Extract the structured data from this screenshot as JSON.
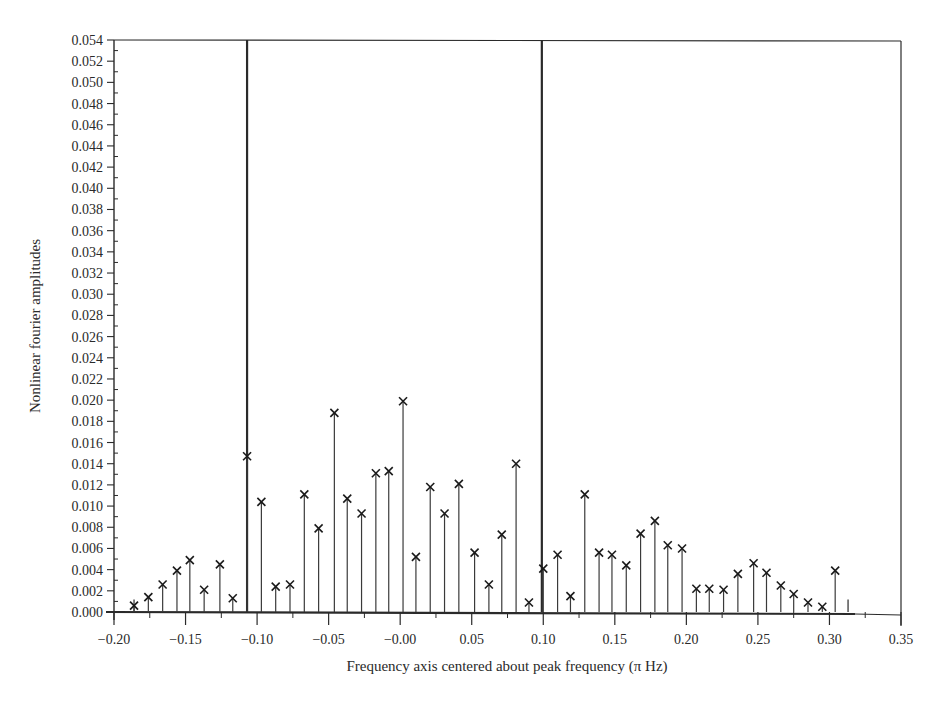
{
  "chart_data": {
    "type": "stem",
    "title": "",
    "xlabel": "Frequency axis centered about peak frequency (π Hz)",
    "ylabel": "Nonlinear fourier amplitudes",
    "xlim": [
      -0.2,
      0.35
    ],
    "ylim": [
      0.0,
      0.054
    ],
    "x_ticks": [
      "−0.20",
      "−0.15",
      "−0.10",
      "−0.05",
      "−0.00",
      "0.05",
      "0.10",
      "0.15",
      "0.20",
      "0.25",
      "0.30",
      "0.35"
    ],
    "x_tick_values": [
      -0.2,
      -0.15,
      -0.1,
      -0.05,
      0.0,
      0.05,
      0.1,
      0.15,
      0.2,
      0.25,
      0.3,
      0.35
    ],
    "y_ticks": [
      "0.000",
      "0.002",
      "0.004",
      "0.006",
      "0.008",
      "0.010",
      "0.012",
      "0.014",
      "0.016",
      "0.018",
      "0.020",
      "0.022",
      "0.024",
      "0.026",
      "0.028",
      "0.030",
      "0.032",
      "0.034",
      "0.036",
      "0.038",
      "0.040",
      "0.042",
      "0.044",
      "0.046",
      "0.048",
      "0.050",
      "0.052",
      "0.054"
    ],
    "grid": false,
    "legend": null,
    "marker": "x",
    "series": [
      {
        "name": "Nonlinear fourier amplitudes",
        "x": [
          -0.186,
          -0.176,
          -0.166,
          -0.156,
          -0.147,
          -0.137,
          -0.126,
          -0.117,
          -0.107,
          -0.097,
          -0.087,
          -0.077,
          -0.067,
          -0.057,
          -0.046,
          -0.037,
          -0.027,
          -0.017,
          -0.008,
          0.002,
          0.011,
          0.021,
          0.031,
          0.041,
          0.052,
          0.062,
          0.071,
          0.081,
          0.09,
          0.1,
          0.11,
          0.119,
          0.129,
          0.139,
          0.148,
          0.158,
          0.168,
          0.178,
          0.187,
          0.197,
          0.207,
          0.216,
          0.226,
          0.236,
          0.247,
          0.256,
          0.266,
          0.275,
          0.285,
          0.295,
          0.304
        ],
        "values": [
          0.0006,
          0.0014,
          0.0026,
          0.0039,
          0.0049,
          0.0021,
          0.0045,
          0.0013,
          0.0147,
          0.0104,
          0.0024,
          0.0026,
          0.0111,
          0.0079,
          0.0188,
          0.0107,
          0.0093,
          0.0131,
          0.0133,
          0.0199,
          0.0052,
          0.0118,
          0.0093,
          0.0121,
          0.0056,
          0.0026,
          0.0073,
          0.014,
          0.0009,
          0.0041,
          0.0054,
          0.0015,
          0.0111,
          0.0056,
          0.0054,
          0.0044,
          0.0074,
          0.0086,
          0.0063,
          0.006,
          0.0022,
          0.0022,
          0.0021,
          0.0036,
          0.0046,
          0.0037,
          0.0025,
          0.0017,
          0.0009,
          0.0005,
          0.0039
        ]
      }
    ],
    "annotations": [
      {
        "type": "vertical_line",
        "x": -0.107,
        "y_top": 0.054,
        "description": "tall boundary line"
      },
      {
        "type": "vertical_line",
        "x": 0.099,
        "y_top": 0.054,
        "description": "tall boundary line"
      },
      {
        "type": "end_tick",
        "x": -0.186,
        "y": 0.001
      },
      {
        "type": "end_tick",
        "x": 0.313,
        "y": 0.001
      }
    ]
  },
  "layout": {
    "plot_left": 114,
    "plot_right": 901,
    "plot_top": 40,
    "plot_bottom": 612,
    "colors": {
      "axis": "#2a2a2a",
      "stem": "#3a3a3a",
      "marker": "#1a1a1a",
      "background": "#ffffff"
    }
  }
}
